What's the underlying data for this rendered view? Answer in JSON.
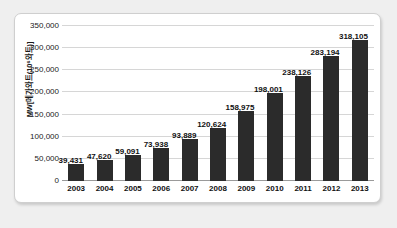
{
  "chart_data": {
    "type": "bar",
    "title": "",
    "subtitle": "",
    "xlabel": "",
    "ylabel": "MW[메가와트(10⁶와트)]",
    "categories": [
      "2003",
      "2004",
      "2005",
      "2006",
      "2007",
      "2008",
      "2009",
      "2010",
      "2011",
      "2012",
      "2013"
    ],
    "values": [
      39431,
      47620,
      59091,
      73938,
      93889,
      120624,
      158975,
      198001,
      238126,
      283194,
      318105
    ],
    "value_labels": [
      "39,431",
      "47,620",
      "59,091",
      "73,938",
      "93,889",
      "120,624",
      "158,975",
      "198,001",
      "238,126",
      "283,194",
      "318,105"
    ],
    "ylim": [
      0,
      350000
    ],
    "ytick_values": [
      0,
      50000,
      100000,
      150000,
      200000,
      250000,
      300000,
      350000
    ],
    "ytick_labels": [
      "0",
      "50,000",
      "100,000",
      "150,000",
      "200,000",
      "250,000",
      "300,000",
      "350,000"
    ],
    "grid": "horizontal",
    "legend": "none",
    "bar_color": "#2b2b2b",
    "gridline_color": "#d6d6d6",
    "panel_background": "#ffffff",
    "page_background": "#efefef"
  }
}
